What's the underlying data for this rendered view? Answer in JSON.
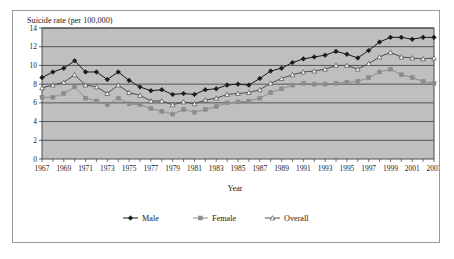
{
  "chart_data": {
    "type": "line",
    "title": "Suicide rate (per 100,000)",
    "xlabel": "Year",
    "ylabel": "",
    "ylim": [
      0,
      14
    ],
    "yticks": [
      0,
      2,
      4,
      6,
      8,
      10,
      12,
      14
    ],
    "ytick_labels": [
      "0",
      "2",
      "4",
      "6",
      "8",
      "10",
      "12",
      "14"
    ],
    "grid": true,
    "legend_position": "bottom",
    "plot_background": "#bfbfbf",
    "x": [
      1967,
      1968,
      1969,
      1970,
      1971,
      1972,
      1973,
      1974,
      1975,
      1976,
      1977,
      1978,
      1979,
      1980,
      1981,
      1982,
      1983,
      1984,
      1985,
      1986,
      1987,
      1988,
      1989,
      1990,
      1991,
      1992,
      1993,
      1994,
      1995,
      1996,
      1997,
      1998,
      1999,
      2000,
      2001,
      2002,
      2003
    ],
    "xtick_labels": [
      "1967",
      "1969",
      "1971",
      "1973",
      "1975",
      "1977",
      "1979",
      "1981",
      "1983",
      "1985",
      "1987",
      "1989",
      "1991",
      "1993",
      "1995",
      "1997",
      "1999",
      "2001",
      "2003"
    ],
    "series": [
      {
        "name": "Male",
        "color": "#1a1a1a",
        "marker": "diamond",
        "marker_fill": "#1a1a1a",
        "values": [
          8.7,
          9.3,
          9.7,
          10.5,
          9.3,
          9.3,
          8.5,
          9.3,
          8.4,
          7.7,
          7.3,
          7.4,
          6.9,
          7.0,
          6.9,
          7.4,
          7.5,
          7.9,
          8.0,
          7.9,
          8.6,
          9.4,
          9.7,
          10.3,
          10.7,
          10.9,
          11.1,
          11.5,
          11.2,
          10.8,
          11.6,
          12.5,
          13.0,
          13.0,
          12.8,
          13.0,
          13.0
        ]
      },
      {
        "name": "Female",
        "color": "#8c8c8c",
        "marker": "square",
        "marker_fill": "#8c8c8c",
        "values": [
          6.6,
          6.6,
          7.0,
          7.7,
          6.5,
          6.2,
          5.8,
          6.5,
          5.9,
          5.8,
          5.4,
          5.1,
          4.8,
          5.3,
          5.0,
          5.3,
          5.6,
          6.0,
          6.1,
          6.2,
          6.5,
          7.1,
          7.5,
          7.9,
          8.1,
          8.0,
          8.0,
          8.1,
          8.2,
          8.3,
          8.7,
          9.3,
          9.6,
          9.0,
          8.7,
          8.3,
          8.1
        ]
      },
      {
        "name": "Overall",
        "color": "#4d4d4d",
        "marker": "triangle",
        "marker_fill": "#ffffff",
        "values": [
          7.6,
          7.9,
          8.2,
          9.0,
          7.9,
          7.7,
          7.0,
          7.9,
          7.1,
          6.8,
          6.2,
          6.2,
          5.8,
          6.1,
          5.9,
          6.3,
          6.5,
          6.9,
          7.0,
          7.1,
          7.4,
          8.1,
          8.6,
          9.0,
          9.3,
          9.4,
          9.6,
          10.0,
          10.0,
          9.6,
          10.2,
          10.9,
          11.4,
          10.9,
          10.8,
          10.7,
          10.8
        ]
      }
    ]
  }
}
